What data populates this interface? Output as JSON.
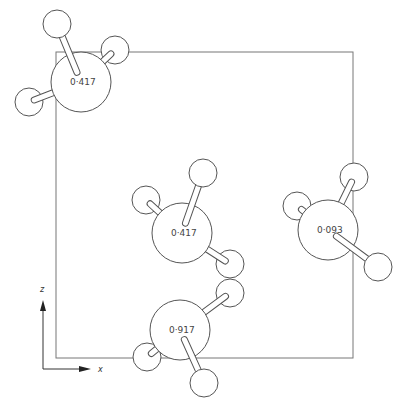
{
  "diagram": {
    "title": "",
    "stroke_color": "#555555",
    "cell_box": {
      "x": 56,
      "y": 52,
      "width": 297,
      "height": 306
    },
    "axes": {
      "origin": {
        "x": 43,
        "y": 369
      },
      "z_label": "z",
      "x_label": "x"
    },
    "molecules": [
      {
        "label": "0·417",
        "center": {
          "x": 81,
          "y": 82
        },
        "r": 30,
        "hydrogens": [
          {
            "x": 57,
            "y": 24,
            "r": 14,
            "front": true
          },
          {
            "x": 115,
            "y": 50,
            "r": 14,
            "front": false
          },
          {
            "x": 29,
            "y": 102,
            "r": 14,
            "front": false
          }
        ]
      },
      {
        "label": "0·417",
        "center": {
          "x": 182,
          "y": 233
        },
        "r": 30,
        "hydrogens": [
          {
            "x": 203,
            "y": 173,
            "r": 14,
            "front": true
          },
          {
            "x": 146,
            "y": 200,
            "r": 14,
            "front": false
          },
          {
            "x": 230,
            "y": 264,
            "r": 14,
            "front": false
          }
        ]
      },
      {
        "label": "0·093",
        "center": {
          "x": 328,
          "y": 230
        },
        "r": 30,
        "hydrogens": [
          {
            "x": 354,
            "y": 177,
            "r": 14,
            "front": false
          },
          {
            "x": 297,
            "y": 206,
            "r": 14,
            "front": false
          },
          {
            "x": 378,
            "y": 267,
            "r": 14,
            "front": true
          }
        ]
      },
      {
        "label": "0·917",
        "center": {
          "x": 180,
          "y": 330
        },
        "r": 30,
        "hydrogens": [
          {
            "x": 230,
            "y": 293,
            "r": 14,
            "front": false
          },
          {
            "x": 147,
            "y": 357,
            "r": 14,
            "front": false
          },
          {
            "x": 204,
            "y": 383,
            "r": 14,
            "front": true
          }
        ]
      }
    ]
  }
}
